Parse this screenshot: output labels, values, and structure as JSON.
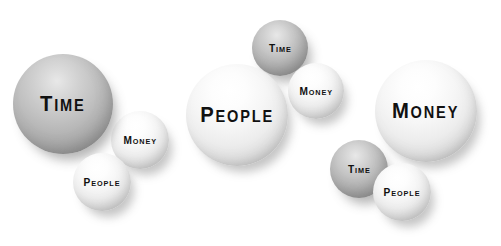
{
  "canvas": {
    "width": 501,
    "height": 246,
    "background": "#ffffff"
  },
  "palette": {
    "grey_sphere": "#b4b4b4",
    "light_sphere": "#ededed",
    "text": "#111111",
    "shadow": "#6e6e6e"
  },
  "diagram": {
    "groups": [
      {
        "name": "group-time-dominant",
        "emphasis": "Time",
        "spheres": [
          {
            "label": "Time",
            "cap": "T",
            "rest": "IME",
            "tone": "grey",
            "size": "large",
            "cx": 63,
            "cy": 104,
            "r": 50,
            "z": 3
          },
          {
            "label": "Money",
            "cap": "M",
            "rest": "ONEY",
            "tone": "light",
            "size": "small",
            "cx": 140,
            "cy": 140,
            "r": 29,
            "z": 2
          },
          {
            "label": "People",
            "cap": "P",
            "rest": "EOPLE",
            "tone": "light",
            "size": "small",
            "cx": 102,
            "cy": 182,
            "r": 29,
            "z": 4
          }
        ]
      },
      {
        "name": "group-people-dominant",
        "emphasis": "People",
        "spheres": [
          {
            "label": "Time",
            "cap": "T",
            "rest": "IME",
            "tone": "grey",
            "size": "small",
            "cx": 280,
            "cy": 48,
            "r": 28,
            "z": 2
          },
          {
            "label": "Money",
            "cap": "M",
            "rest": "ONEY",
            "tone": "light",
            "size": "small",
            "cx": 316,
            "cy": 91,
            "r": 28,
            "z": 3
          },
          {
            "label": "People",
            "cap": "P",
            "rest": "EOPLE",
            "tone": "light",
            "size": "large",
            "cx": 237,
            "cy": 115,
            "r": 51,
            "z": 4
          }
        ]
      },
      {
        "name": "group-money-dominant",
        "emphasis": "Money",
        "spheres": [
          {
            "label": "Money",
            "cap": "M",
            "rest": "ONEY",
            "tone": "light",
            "size": "large",
            "cx": 426,
            "cy": 111,
            "r": 51,
            "z": 3
          },
          {
            "label": "Time",
            "cap": "T",
            "rest": "IME",
            "tone": "grey",
            "size": "small",
            "cx": 359,
            "cy": 169,
            "r": 29,
            "z": 2
          },
          {
            "label": "People",
            "cap": "P",
            "rest": "EOPLE",
            "tone": "light",
            "size": "small",
            "cx": 402,
            "cy": 192,
            "r": 29,
            "z": 4
          }
        ]
      }
    ]
  }
}
